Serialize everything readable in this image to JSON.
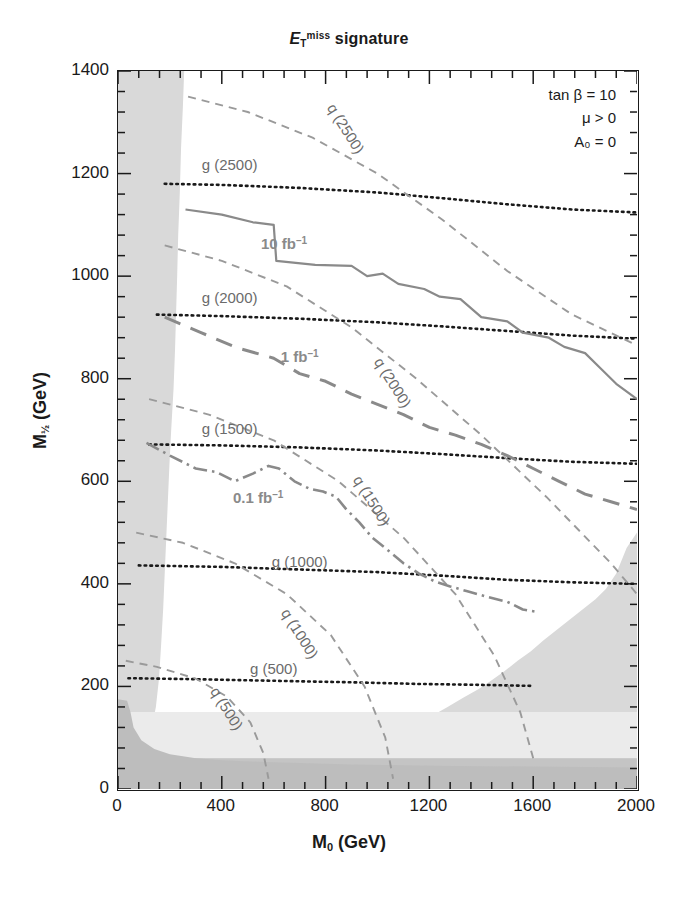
{
  "title": {
    "prefix_italic": "E",
    "sub": "T",
    "sup": "miss",
    "suffix": " signature"
  },
  "legend": {
    "line1": "tan β = 10",
    "line2": "μ > 0",
    "line3": "A₀ = 0"
  },
  "axes": {
    "xtitle_main": "M",
    "xtitle_sub": "0",
    "xtitle_unit": " (GeV)",
    "ytitle_main": "M",
    "ytitle_sub": "½",
    "ytitle_unit": " (GeV)",
    "xticks": [
      "0",
      "400",
      "800",
      "1200",
      "1600",
      "2000"
    ],
    "yticks": [
      "0",
      "200",
      "400",
      "600",
      "800",
      "1000",
      "1200",
      "1400"
    ]
  },
  "chart_data": {
    "type": "line",
    "xlabel": "M_0 (GeV)",
    "ylabel": "M_1/2 (GeV)",
    "xlim": [
      0,
      2000
    ],
    "ylim": [
      0,
      1400
    ],
    "xtick_step": 400,
    "ytick_step": 200,
    "minor_ticks_per_major": 4,
    "grid": false,
    "legend_position": "top-right",
    "annotations": [
      "tan β = 10",
      "μ > 0",
      "A₀ = 0"
    ],
    "colors": {
      "frame": "#1a1a1a",
      "gluino_contour": "#1a1a1a",
      "squark_contour": "#9a9a9a",
      "reach_contour": "#8a8a8a",
      "excluded_light": "#d9d9d9",
      "excluded_pale": "#ebebeb",
      "excluded_dark": "#c4c4c4",
      "label_grey": "#6b6b6b"
    },
    "series": [
      {
        "name": "g (2500)",
        "label": "g (2500)",
        "style": "dotted",
        "color": "#1a1a1a",
        "label_xy": [
          430,
          1215
        ],
        "points": [
          [
            180,
            1180
          ],
          [
            400,
            1178
          ],
          [
            700,
            1172
          ],
          [
            1000,
            1163
          ],
          [
            1250,
            1152
          ],
          [
            1500,
            1140
          ],
          [
            1750,
            1130
          ],
          [
            2000,
            1124
          ]
        ]
      },
      {
        "name": "g (2000)",
        "label": "g (2000)",
        "style": "dotted",
        "color": "#1a1a1a",
        "label_xy": [
          430,
          955
        ],
        "points": [
          [
            150,
            925
          ],
          [
            400,
            922
          ],
          [
            700,
            917
          ],
          [
            1000,
            910
          ],
          [
            1250,
            902
          ],
          [
            1500,
            893
          ],
          [
            1750,
            884
          ],
          [
            2000,
            878
          ]
        ]
      },
      {
        "name": "g (1500)",
        "label": "g (1500)",
        "style": "dotted",
        "color": "#1a1a1a",
        "label_xy": [
          430,
          700
        ],
        "points": [
          [
            120,
            672
          ],
          [
            400,
            670
          ],
          [
            700,
            666
          ],
          [
            1000,
            660
          ],
          [
            1250,
            653
          ],
          [
            1500,
            645
          ],
          [
            1750,
            638
          ],
          [
            2000,
            634
          ]
        ]
      },
      {
        "name": "g (1000)",
        "label": "g (1000)",
        "style": "dotted",
        "color": "#1a1a1a",
        "label_xy": [
          700,
          440
        ],
        "points": [
          [
            80,
            436
          ],
          [
            400,
            433
          ],
          [
            700,
            428
          ],
          [
            1000,
            423
          ],
          [
            1250,
            416
          ],
          [
            1500,
            408
          ],
          [
            1750,
            403
          ],
          [
            2000,
            400
          ]
        ]
      },
      {
        "name": "g (500)",
        "label": "g (500)",
        "style": "dotted",
        "color": "#1a1a1a",
        "label_xy": [
          600,
          232
        ],
        "points": [
          [
            40,
            216
          ],
          [
            300,
            214
          ],
          [
            600,
            211
          ],
          [
            900,
            208
          ],
          [
            1150,
            205
          ],
          [
            1400,
            203
          ],
          [
            1600,
            201
          ]
        ]
      },
      {
        "name": "q (2500)",
        "label": "q (2500)",
        "style": "dashed",
        "color": "#9a9a9a",
        "label_xy": [
          880,
          1285
        ],
        "points": [
          [
            270,
            1350
          ],
          [
            500,
            1320
          ],
          [
            750,
            1270
          ],
          [
            1000,
            1200
          ],
          [
            1250,
            1110
          ],
          [
            1500,
            1010
          ],
          [
            1750,
            925
          ],
          [
            2000,
            865
          ]
        ]
      },
      {
        "name": "q (2000)",
        "label": "q (2000)",
        "style": "dashed",
        "color": "#9a9a9a",
        "label_xy": [
          1060,
          790
        ],
        "points": [
          [
            180,
            1060
          ],
          [
            400,
            1030
          ],
          [
            650,
            980
          ],
          [
            900,
            900
          ],
          [
            1150,
            800
          ],
          [
            1400,
            690
          ],
          [
            1650,
            570
          ],
          [
            1900,
            440
          ],
          [
            2000,
            380
          ]
        ]
      },
      {
        "name": "q (1500)",
        "label": "q (1500)",
        "style": "dashed",
        "color": "#9a9a9a",
        "label_xy": [
          980,
          560
        ],
        "points": [
          [
            120,
            760
          ],
          [
            350,
            730
          ],
          [
            600,
            680
          ],
          [
            850,
            600
          ],
          [
            1100,
            490
          ],
          [
            1300,
            380
          ],
          [
            1450,
            260
          ],
          [
            1550,
            150
          ],
          [
            1600,
            60
          ]
        ]
      },
      {
        "name": "q (1000)",
        "label": "q (1000)",
        "style": "dashed",
        "color": "#9a9a9a",
        "label_xy": [
          700,
          300
        ],
        "points": [
          [
            70,
            500
          ],
          [
            250,
            480
          ],
          [
            450,
            440
          ],
          [
            650,
            380
          ],
          [
            820,
            300
          ],
          [
            950,
            200
          ],
          [
            1030,
            100
          ],
          [
            1060,
            20
          ]
        ]
      },
      {
        "name": "q (500)",
        "label": "q (500)",
        "style": "dashed",
        "color": "#9a9a9a",
        "label_xy": [
          420,
          155
        ],
        "points": [
          [
            30,
            250
          ],
          [
            150,
            238
          ],
          [
            300,
            215
          ],
          [
            420,
            180
          ],
          [
            510,
            130
          ],
          [
            560,
            70
          ],
          [
            580,
            20
          ]
        ]
      },
      {
        "name": "10 fb-1",
        "label": "10 fb",
        "label_sup": "–1",
        "style": "solid",
        "color": "#8a8a8a",
        "label_xy": [
          640,
          1060
        ],
        "points": [
          [
            260,
            1130
          ],
          [
            400,
            1120
          ],
          [
            520,
            1105
          ],
          [
            600,
            1100
          ],
          [
            610,
            1030
          ],
          [
            760,
            1022
          ],
          [
            900,
            1020
          ],
          [
            960,
            1000
          ],
          [
            1020,
            1005
          ],
          [
            1080,
            985
          ],
          [
            1180,
            975
          ],
          [
            1240,
            960
          ],
          [
            1320,
            955
          ],
          [
            1400,
            920
          ],
          [
            1500,
            912
          ],
          [
            1560,
            890
          ],
          [
            1660,
            880
          ],
          [
            1720,
            862
          ],
          [
            1800,
            850
          ],
          [
            1860,
            820
          ],
          [
            1920,
            790
          ],
          [
            2000,
            760
          ]
        ]
      },
      {
        "name": "1 fb-1",
        "label": "1 fb",
        "label_sup": "–1",
        "style": "longdash",
        "color": "#8a8a8a",
        "label_xy": [
          700,
          840
        ],
        "points": [
          [
            180,
            920
          ],
          [
            320,
            890
          ],
          [
            460,
            860
          ],
          [
            600,
            840
          ],
          [
            700,
            810
          ],
          [
            800,
            795
          ],
          [
            900,
            770
          ],
          [
            1000,
            750
          ],
          [
            1100,
            730
          ],
          [
            1200,
            705
          ],
          [
            1300,
            690
          ],
          [
            1400,
            672
          ],
          [
            1500,
            650
          ],
          [
            1600,
            625
          ],
          [
            1700,
            600
          ],
          [
            1800,
            575
          ],
          [
            1900,
            560
          ],
          [
            2000,
            545
          ]
        ]
      },
      {
        "name": "0.1 fb-1",
        "label": "0.1 fb",
        "label_sup": "–1",
        "style": "dashdot",
        "color": "#8a8a8a",
        "label_xy": [
          540,
          565
        ],
        "points": [
          [
            110,
            675
          ],
          [
            200,
            650
          ],
          [
            300,
            625
          ],
          [
            380,
            618
          ],
          [
            450,
            600
          ],
          [
            520,
            615
          ],
          [
            580,
            630
          ],
          [
            620,
            625
          ],
          [
            680,
            600
          ],
          [
            740,
            585
          ],
          [
            790,
            580
          ],
          [
            840,
            570
          ],
          [
            880,
            545
          ],
          [
            930,
            520
          ],
          [
            980,
            490
          ],
          [
            1030,
            470
          ],
          [
            1100,
            440
          ],
          [
            1160,
            420
          ],
          [
            1220,
            405
          ],
          [
            1280,
            395
          ],
          [
            1350,
            385
          ],
          [
            1420,
            375
          ],
          [
            1500,
            365
          ],
          [
            1560,
            350
          ],
          [
            1620,
            345
          ]
        ]
      }
    ],
    "shaded_regions": [
      {
        "name": "left-excluded",
        "tone": "#d9d9d9",
        "polygon": [
          [
            0,
            1400
          ],
          [
            255,
            1400
          ],
          [
            250,
            1330
          ],
          [
            243,
            1250
          ],
          [
            238,
            1160
          ],
          [
            232,
            1080
          ],
          [
            228,
            1000
          ],
          [
            224,
            930
          ],
          [
            220,
            860
          ],
          [
            214,
            780
          ],
          [
            205,
            700
          ],
          [
            198,
            630
          ],
          [
            192,
            560
          ],
          [
            186,
            490
          ],
          [
            180,
            420
          ],
          [
            174,
            350
          ],
          [
            166,
            280
          ],
          [
            158,
            215
          ],
          [
            146,
            160
          ],
          [
            130,
            120
          ],
          [
            112,
            90
          ],
          [
            90,
            55
          ],
          [
            70,
            30
          ],
          [
            55,
            10
          ],
          [
            48,
            0
          ],
          [
            0,
            0
          ]
        ]
      },
      {
        "name": "bottom-right-excluded",
        "tone": "#d9d9d9",
        "polygon": [
          [
            2000,
            0
          ],
          [
            2000,
            500
          ],
          [
            1960,
            470
          ],
          [
            1920,
            420
          ],
          [
            1880,
            390
          ],
          [
            1840,
            370
          ],
          [
            1790,
            350
          ],
          [
            1740,
            330
          ],
          [
            1690,
            310
          ],
          [
            1640,
            290
          ],
          [
            1590,
            268
          ],
          [
            1540,
            250
          ],
          [
            1490,
            230
          ],
          [
            1440,
            212
          ],
          [
            1390,
            195
          ],
          [
            1330,
            178
          ],
          [
            1270,
            160
          ],
          [
            1200,
            140
          ],
          [
            1120,
            122
          ],
          [
            1040,
            110
          ],
          [
            960,
            100
          ],
          [
            880,
            94
          ],
          [
            800,
            90
          ],
          [
            700,
            86
          ],
          [
            600,
            84
          ],
          [
            500,
            82
          ],
          [
            400,
            80
          ],
          [
            300,
            78
          ],
          [
            200,
            76
          ],
          [
            100,
            74
          ],
          [
            0,
            72
          ],
          [
            0,
            0
          ]
        ]
      },
      {
        "name": "bottom-band-pale",
        "tone": "#ebebeb",
        "polygon": [
          [
            0,
            150
          ],
          [
            2000,
            150
          ],
          [
            2000,
            60
          ],
          [
            0,
            60
          ]
        ]
      },
      {
        "name": "bottom-strip-dark",
        "tone": "#c4c4c4",
        "polygon": [
          [
            0,
            60
          ],
          [
            2000,
            60
          ],
          [
            2000,
            0
          ],
          [
            0,
            0
          ]
        ]
      },
      {
        "name": "left-lower-corner",
        "tone": "#bdbdbd",
        "polygon": [
          [
            0,
            175
          ],
          [
            35,
            172
          ],
          [
            48,
            150
          ],
          [
            60,
            120
          ],
          [
            90,
            95
          ],
          [
            140,
            78
          ],
          [
            200,
            68
          ],
          [
            300,
            60
          ],
          [
            400,
            56
          ],
          [
            600,
            52
          ],
          [
            900,
            48
          ],
          [
            1300,
            45
          ],
          [
            2000,
            42
          ],
          [
            2000,
            0
          ],
          [
            0,
            0
          ]
        ]
      }
    ]
  }
}
